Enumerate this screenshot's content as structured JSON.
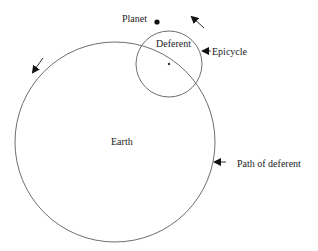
{
  "diagram": {
    "labels": {
      "planet": "Planet",
      "deferent": "Deferent",
      "epicycle": "Epicycle",
      "earth": "Earth",
      "path_of_deferent": "Path of deferent"
    },
    "colors": {
      "line": "#6e6e6e",
      "text": "#222222",
      "arrow": "#111111",
      "background": "#ffffff"
    },
    "shapes": {
      "deferent_circle": {
        "cx": 115,
        "cy": 142,
        "r": 100
      },
      "epicycle_circle": {
        "cx": 169,
        "cy": 64,
        "r": 33
      },
      "planet_dot": {
        "cx": 157,
        "cy": 22,
        "r": 2.6
      },
      "epicycle_center_dot": {
        "cx": 169,
        "cy": 64,
        "r": 1.2
      }
    },
    "arrows": [
      {
        "name": "epicycle-rotation-arrow",
        "direction": "up-left"
      },
      {
        "name": "deferent-rotation-arrow",
        "direction": "down-left"
      },
      {
        "name": "epicycle-pointer-arrow",
        "direction": "left"
      },
      {
        "name": "path-of-deferent-pointer-arrow",
        "direction": "left"
      }
    ]
  }
}
